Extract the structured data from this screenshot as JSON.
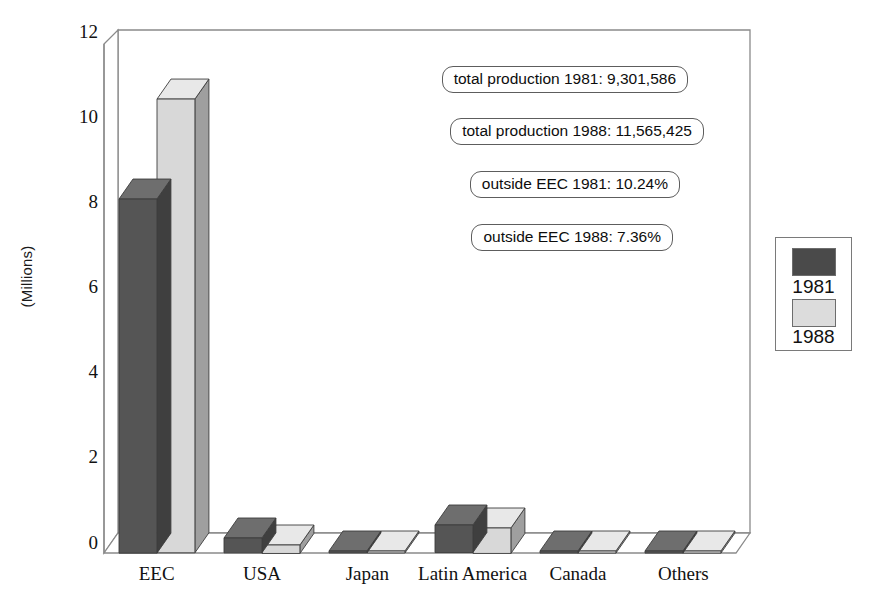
{
  "chart_data": {
    "type": "bar",
    "style": "3d-clustered-column",
    "title": "",
    "xlabel": "",
    "ylabel": "(Millions)",
    "ylim": [
      0,
      12
    ],
    "yticks": [
      "0",
      "2",
      "4",
      "6",
      "8",
      "10",
      "12"
    ],
    "grid": false,
    "legend_position": "right-outside",
    "categories": [
      "EEC",
      "USA",
      "Japan",
      "Latin America",
      "Canada",
      "Others"
    ],
    "series": [
      {
        "name": "1981",
        "color": "#555555",
        "values": [
          8.35,
          0.35,
          0.02,
          0.65,
          0.05,
          0.05
        ]
      },
      {
        "name": "1988",
        "color": "#d8d8d8",
        "values": [
          10.7,
          0.2,
          0.02,
          0.6,
          0.05,
          0.05
        ]
      }
    ],
    "annotations": [
      "total production 1981: 9,301,586",
      "total production 1988: 11,565,425",
      "outside EEC 1981: 10.24%",
      "outside EEC 1988: 7.36%"
    ]
  },
  "legend": {
    "entries": [
      {
        "label": "1981",
        "color": "#4a4a4a"
      },
      {
        "label": "1988",
        "color": "#dcdcdc"
      }
    ]
  },
  "colors": {
    "bar_1981_front": "#555555",
    "bar_1981_top": "#6e6e6e",
    "bar_1981_side": "#3f3f3f",
    "bar_1988_front": "#d8d8d8",
    "bar_1988_top": "#e8e8e8",
    "bar_1988_side": "#9f9f9f",
    "frame": "#8a8a8a",
    "text": "#111111"
  }
}
